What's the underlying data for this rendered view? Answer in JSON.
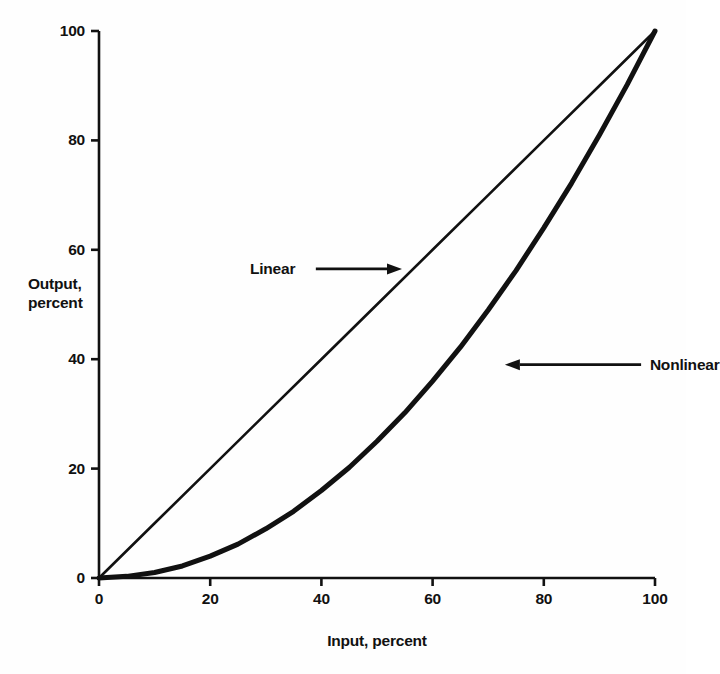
{
  "chart_data": {
    "type": "line",
    "title": "",
    "subtitle": "",
    "xlabel": "Input, percent",
    "ylabel": "Output,\npercent",
    "ylabel_line1": "Output,",
    "ylabel_line2": "percent",
    "xlim": [
      0,
      100
    ],
    "ylim": [
      0,
      100
    ],
    "xticks": [
      0,
      20,
      40,
      60,
      80,
      100
    ],
    "yticks": [
      0,
      20,
      40,
      60,
      80,
      100
    ],
    "xtick_labels": [
      "0",
      "20",
      "40",
      "60",
      "80",
      "100"
    ],
    "ytick_labels": [
      "0",
      "20",
      "40",
      "60",
      "80",
      "100"
    ],
    "grid": false,
    "legend_position": "inline-annotations",
    "line_color": "#111111",
    "background_color": "#fefefe",
    "series": [
      {
        "name": "Linear",
        "stroke_width": 2.6,
        "x": [
          0,
          10,
          20,
          30,
          40,
          50,
          60,
          70,
          80,
          90,
          100
        ],
        "values": [
          0,
          10,
          20,
          30,
          40,
          50,
          60,
          70,
          80,
          90,
          100
        ]
      },
      {
        "name": "Nonlinear",
        "stroke_width": 5.0,
        "x": [
          0,
          5,
          10,
          15,
          20,
          25,
          30,
          35,
          40,
          45,
          50,
          55,
          60,
          65,
          70,
          75,
          80,
          85,
          90,
          95,
          100
        ],
        "values": [
          0,
          0.3,
          1.0,
          2.2,
          4.0,
          6.2,
          9.0,
          12.2,
          16.0,
          20.2,
          25.0,
          30.2,
          36.0,
          42.2,
          49.0,
          56.2,
          64.0,
          72.2,
          81.0,
          90.2,
          100
        ]
      }
    ],
    "annotations": [
      {
        "label": "Linear",
        "arrow_direction": "right",
        "text_x": 33.5,
        "text_y": 56.5,
        "arrow_from_x": 39.0,
        "arrow_from_y": 56.5,
        "arrow_to_x": 54.5,
        "arrow_to_y": 56.5
      },
      {
        "label": "Nonlinear",
        "arrow_direction": "left",
        "text_x": 98.0,
        "text_y": 39.0,
        "arrow_from_x": 97.5,
        "arrow_from_y": 39.0,
        "arrow_to_x": 73.0,
        "arrow_to_y": 39.0
      }
    ]
  }
}
